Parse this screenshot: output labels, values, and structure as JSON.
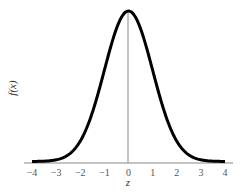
{
  "chart_data": {
    "type": "line",
    "title": "",
    "xlabel": "z",
    "ylabel": "f(x)",
    "x_ticks": [
      "-4",
      "-3",
      "-2",
      "-1",
      "0",
      "1",
      "2",
      "3",
      "4"
    ],
    "xlim": [
      -4,
      4
    ],
    "ylim": [
      0,
      0.4
    ],
    "grid": false,
    "legend": null,
    "series": [
      {
        "name": "standard normal density",
        "x": [
          -4,
          -3.5,
          -3,
          -2.5,
          -2,
          -1.5,
          -1,
          -0.5,
          0,
          0.5,
          1,
          1.5,
          2,
          2.5,
          3,
          3.5,
          4
        ],
        "y": [
          0.0001,
          0.0009,
          0.0044,
          0.0175,
          0.054,
          0.1295,
          0.242,
          0.3521,
          0.3989,
          0.3521,
          0.242,
          0.1295,
          0.054,
          0.0175,
          0.0044,
          0.0009,
          0.0001
        ]
      }
    ],
    "annotations": [
      "vertical line at z = 0"
    ]
  },
  "axes": {
    "x_label": "z",
    "y_label": "f(x)",
    "ticks": [
      "-4",
      "-3",
      "-2",
      "-1",
      "0",
      "1",
      "2",
      "3",
      "4"
    ]
  }
}
